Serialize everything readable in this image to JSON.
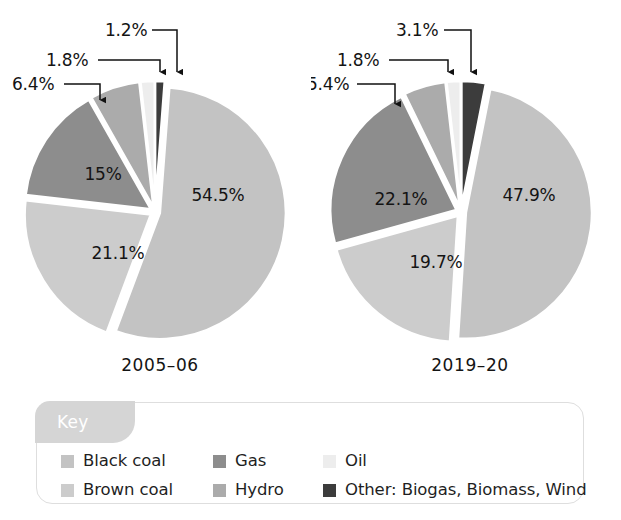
{
  "figure": {
    "background": "#ffffff"
  },
  "charts": [
    {
      "id": "pie-2005-06",
      "year_label": "2005–06",
      "slices": [
        {
          "key": "other",
          "label": "1.2%",
          "value": 1.2,
          "color": "#3c3c3c",
          "callout": true
        },
        {
          "key": "black-coal",
          "label": "54.5%",
          "value": 54.5,
          "color": "#c3c3c3",
          "callout": false
        },
        {
          "key": "brown-coal",
          "label": "21.1%",
          "value": 21.1,
          "color": "#cccccc",
          "callout": false
        },
        {
          "key": "gas",
          "label": "15%",
          "value": 15.0,
          "color": "#8d8d8d",
          "callout": false
        },
        {
          "key": "hydro",
          "label": "6.4%",
          "value": 6.4,
          "color": "#ababab",
          "callout": true
        },
        {
          "key": "oil",
          "label": "1.8%",
          "value": 1.8,
          "color": "#ededed",
          "callout": true
        }
      ]
    },
    {
      "id": "pie-2019-20",
      "year_label": "2019–20",
      "slices": [
        {
          "key": "other",
          "label": "3.1%",
          "value": 3.1,
          "color": "#3c3c3c",
          "callout": true
        },
        {
          "key": "black-coal",
          "label": "47.9%",
          "value": 47.9,
          "color": "#c3c3c3",
          "callout": false
        },
        {
          "key": "brown-coal",
          "label": "19.7%",
          "value": 19.7,
          "color": "#cccccc",
          "callout": false
        },
        {
          "key": "gas",
          "label": "22.1%",
          "value": 22.1,
          "color": "#8d8d8d",
          "callout": false
        },
        {
          "key": "hydro",
          "label": "5.4%",
          "value": 5.4,
          "color": "#ababab",
          "callout": true
        },
        {
          "key": "oil",
          "label": "1.8%",
          "value": 1.8,
          "color": "#ededed",
          "callout": true
        }
      ]
    }
  ],
  "legend": {
    "title": "Key",
    "title_bg": "#d5d5d5",
    "border_color": "#dedede",
    "items": [
      {
        "key": "black-coal",
        "label": "Black coal",
        "color": "#c3c3c3"
      },
      {
        "key": "gas",
        "label": "Gas",
        "color": "#8d8d8d"
      },
      {
        "key": "oil",
        "label": "Oil",
        "color": "#ededed"
      },
      {
        "key": "brown-coal",
        "label": "Brown coal",
        "color": "#cccccc"
      },
      {
        "key": "hydro",
        "label": "Hydro",
        "color": "#ababab"
      },
      {
        "key": "other",
        "label": "Other: Biogas, Biomass, Wind",
        "color": "#3c3c3c"
      }
    ]
  },
  "chart_data": {
    "type": "pie",
    "title": "",
    "categories": [
      "Black coal",
      "Brown coal",
      "Gas",
      "Hydro",
      "Oil",
      "Other: Biogas, Biomass, Wind"
    ],
    "unit": "%",
    "legend_position": "bottom",
    "grid": false,
    "series": [
      {
        "name": "2005–06",
        "values": [
          54.5,
          21.1,
          15.0,
          6.4,
          1.8,
          1.2
        ],
        "labels": [
          "54.5%",
          "21.1%",
          "15%",
          "6.4%",
          "1.8%",
          "1.2%"
        ]
      },
      {
        "name": "2019–20",
        "values": [
          47.9,
          19.7,
          22.1,
          5.4,
          1.8,
          3.1
        ],
        "labels": [
          "47.9%",
          "19.7%",
          "22.1%",
          "5.4%",
          "1.8%",
          "3.1%"
        ]
      }
    ],
    "colors": {
      "Black coal": "#c3c3c3",
      "Brown coal": "#cccccc",
      "Gas": "#8d8d8d",
      "Hydro": "#ababab",
      "Oil": "#ededed",
      "Other: Biogas, Biomass, Wind": "#3c3c3c"
    }
  }
}
